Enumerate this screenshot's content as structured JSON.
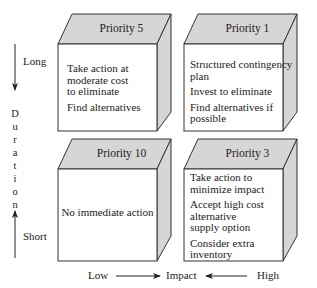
{
  "diagram": {
    "type": "2x2 priority matrix",
    "quadrants": [
      {
        "position": "top-left",
        "title": "Priority 5",
        "actions": [
          "Take action at moderate cost to eliminate",
          "Find alternatives"
        ]
      },
      {
        "position": "top-right",
        "title": "Priority 1",
        "actions": [
          "Structured contingency plan",
          "Invest to eliminate",
          "Find alternatives if possible"
        ]
      },
      {
        "position": "bottom-left",
        "title": "Priority 10",
        "actions": [
          "No immediate action"
        ]
      },
      {
        "position": "bottom-right",
        "title": "Priority 3",
        "actions": [
          "Take action to minimize impact",
          "Accept high cost alternative supply option",
          "Consider extra inventory"
        ]
      }
    ],
    "y_axis": {
      "label": "Duration",
      "label_letters": [
        "D",
        "u",
        "r",
        "a",
        "t",
        "i",
        "o",
        "n"
      ],
      "top": "Long",
      "bottom": "Short"
    },
    "x_axis": {
      "label": "Impact",
      "left": "Low",
      "right": "High"
    },
    "colors": {
      "face_gray": "#d4d4d4",
      "front_white": "#ffffff",
      "line": "#333333"
    }
  },
  "text": {
    "q1_title": "Priority 5",
    "q1_line1": "Take action at",
    "q1_line2": "moderate cost",
    "q1_line3": "to eliminate",
    "q1_line4": "Find alternatives",
    "q2_title": "Priority 1",
    "q2_line1": "Structured contingency",
    "q2_line2": "plan",
    "q2_line3": "Invest to eliminate",
    "q2_line4": "Find alternatives if",
    "q2_line5": "possible",
    "q3_title": "Priority 10",
    "q3_line1": "No immediate action",
    "q4_title": "Priority 3",
    "q4_line1": "Take action to",
    "q4_line2": "minimize impact",
    "q4_line3": "Accept high cost",
    "q4_line4": "alternative",
    "q4_line5": "supply option",
    "q4_line6": "Consider extra",
    "q4_line7": "inventory",
    "long": "Long",
    "short": "Short",
    "low": "Low",
    "impact": "Impact",
    "high": "High"
  }
}
